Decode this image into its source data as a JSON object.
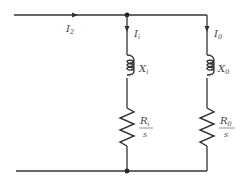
{
  "diagram": {
    "type": "circuit",
    "colors": {
      "line": "#333333",
      "text": "#444444",
      "background": "#ffffff"
    },
    "input_current": {
      "symbol": "I",
      "subscript": "2"
    },
    "branches": [
      {
        "name": "inner",
        "current": {
          "symbol": "I",
          "subscript": "i"
        },
        "reactance": {
          "symbol": "X",
          "subscript": "i"
        },
        "resistance": {
          "numerator_symbol": "R",
          "numerator_subscript": "i",
          "denominator": "s"
        }
      },
      {
        "name": "outer",
        "current": {
          "symbol": "I",
          "subscript": "0"
        },
        "reactance": {
          "symbol": "X",
          "subscript": "0"
        },
        "resistance": {
          "numerator_symbol": "R",
          "numerator_subscript": "0",
          "denominator": "s"
        }
      }
    ]
  }
}
